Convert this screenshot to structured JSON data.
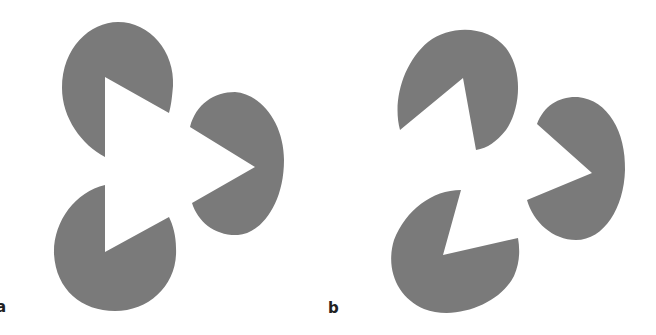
{
  "figure": {
    "panels": [
      {
        "label": "a",
        "description": "Kanizsa illusory triangle formed by three notched discs with aligned wedges"
      },
      {
        "label": "b",
        "description": "Same three notched discs rotated so the wedges do not align"
      }
    ],
    "colors": {
      "shape": "#7a7a7a",
      "background": "#ffffff"
    }
  }
}
